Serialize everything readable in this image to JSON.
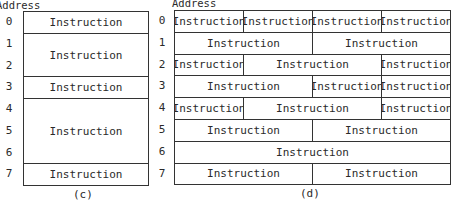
{
  "diagram_c": {
    "address_label": "Address",
    "addresses": [
      "0",
      "1",
      "2",
      "3",
      "4",
      "5",
      "6",
      "7"
    ],
    "blocks": [
      {
        "label": "Instruction",
        "start": 0,
        "span": 1
      },
      {
        "label": "Instruction",
        "start": 1,
        "span": 2
      },
      {
        "label": "Instruction",
        "start": 3,
        "span": 1
      },
      {
        "label": "Instruction",
        "start": 4,
        "span": 3
      },
      {
        "label": "Instruction",
        "start": 7,
        "span": 1
      }
    ],
    "caption": "(c)"
  },
  "diagram_d": {
    "address_label": "Address",
    "addresses": [
      "0",
      "1",
      "2",
      "3",
      "4",
      "5",
      "6",
      "7"
    ],
    "rows": [
      [
        {
          "label": "Instruction",
          "cols": 1
        },
        {
          "label": "Instruction",
          "cols": 1
        },
        {
          "label": "Instruction",
          "cols": 1
        },
        {
          "label": "Instruction",
          "cols": 1
        }
      ],
      [
        {
          "label": "Instruction",
          "cols": 2
        },
        {
          "label": "Instruction",
          "cols": 2
        }
      ],
      [
        {
          "label": "Instruction",
          "cols": 1
        },
        {
          "label": "Instruction",
          "cols": 2
        },
        {
          "label": "Instruction",
          "cols": 1
        }
      ],
      [
        {
          "label": "Instruction",
          "cols": 2
        },
        {
          "label": "Instruction",
          "cols": 1
        },
        {
          "label": "Instruction",
          "cols": 1
        }
      ],
      [
        {
          "label": "Instruction",
          "cols": 1
        },
        {
          "label": "Instruction",
          "cols": 2
        },
        {
          "label": "Instruction",
          "cols": 1
        }
      ],
      [
        {
          "label": "Instruction",
          "cols": 2
        },
        {
          "label": "Instruction",
          "cols": 2
        }
      ],
      [
        {
          "label": "Instruction",
          "cols": 4
        }
      ],
      [
        {
          "label": "Instruction",
          "cols": 2
        },
        {
          "label": "Instruction",
          "cols": 2
        }
      ]
    ],
    "caption": "(d)"
  }
}
